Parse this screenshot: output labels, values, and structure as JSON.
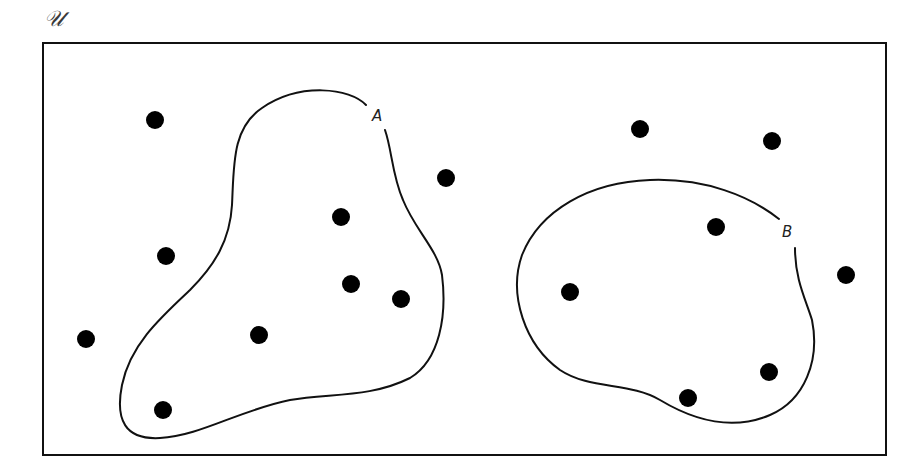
{
  "diagram": {
    "type": "venn-diagram",
    "universe": {
      "label": "𝒰",
      "frame": {
        "x": 43,
        "y": 43,
        "width": 843,
        "height": 412
      }
    },
    "sets": [
      {
        "label": "A",
        "label_pos": {
          "x": 378,
          "y": 121
        },
        "path": "M 366 105 C 350 88, 300 82, 262 108 C 232 128, 234 165, 232 205 C 230 240, 215 265, 190 290 C 160 318, 130 345, 122 385 C 115 420, 125 440, 160 438 C 200 436, 240 410, 290 400 C 330 393, 370 398, 410 378 C 440 360, 447 315, 442 275 C 438 250, 415 230, 403 200 C 392 175, 392 150, 385 130"
      },
      {
        "label": "B",
        "label_pos": {
          "x": 788,
          "y": 237
        },
        "path": "M 779 219 C 750 196, 705 178, 650 180 C 590 182, 540 210, 522 255 C 508 295, 525 345, 560 370 C 590 390, 630 382, 660 400 C 690 418, 730 432, 770 415 C 805 400, 820 360, 812 320 C 806 300, 795 280, 795 248"
      }
    ],
    "elements": [
      {
        "x": 155,
        "y": 120,
        "in": "none"
      },
      {
        "x": 166,
        "y": 256,
        "in": "none"
      },
      {
        "x": 86,
        "y": 339,
        "in": "none"
      },
      {
        "x": 446,
        "y": 178,
        "in": "none"
      },
      {
        "x": 341,
        "y": 217,
        "in": "A"
      },
      {
        "x": 351,
        "y": 284,
        "in": "A"
      },
      {
        "x": 401,
        "y": 299,
        "in": "A"
      },
      {
        "x": 259,
        "y": 335,
        "in": "A"
      },
      {
        "x": 163,
        "y": 410,
        "in": "A"
      },
      {
        "x": 640,
        "y": 129,
        "in": "none"
      },
      {
        "x": 772,
        "y": 141,
        "in": "none"
      },
      {
        "x": 846,
        "y": 275,
        "in": "none"
      },
      {
        "x": 716,
        "y": 227,
        "in": "B"
      },
      {
        "x": 570,
        "y": 292,
        "in": "B"
      },
      {
        "x": 769,
        "y": 372,
        "in": "B"
      },
      {
        "x": 688,
        "y": 398,
        "in": "B"
      }
    ],
    "colors": {
      "stroke": "#111111",
      "dot": "#000000",
      "background": "#ffffff"
    }
  }
}
